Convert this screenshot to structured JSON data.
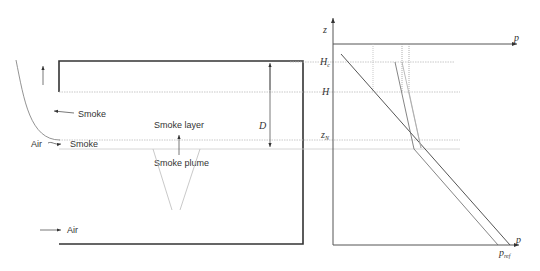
{
  "left_diagram": {
    "labels": {
      "smoke_exit": "Smoke",
      "air_inflow_upper": "Air",
      "smoke_upper": "Smoke",
      "smoke_layer": "Smoke layer",
      "smoke_plume": "Smoke plume",
      "air_inflow_lower": "Air",
      "depth": "D"
    }
  },
  "right_diagram": {
    "axis_labels": {
      "z": "z",
      "p_top": "p",
      "p_bottom": "p",
      "H_c": "H",
      "H_c_sub": "c",
      "H": "H",
      "z_N": "z",
      "z_N_sub": "N",
      "p_ref": "p",
      "p_ref_sub": "ref"
    }
  },
  "colors": {
    "frame": "#333333",
    "line": "#666666",
    "light_line": "#aaaaaa",
    "dotted": "#bbbbbb"
  }
}
